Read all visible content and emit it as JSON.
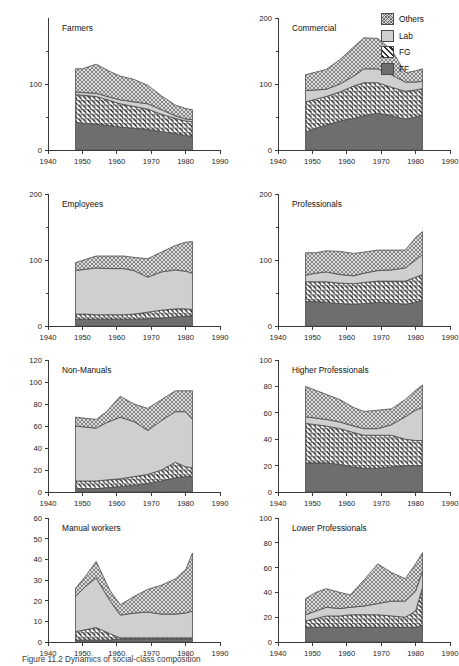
{
  "figure": {
    "caption": "Figure 11.2 Dynamics of social-class composition",
    "legend": {
      "position": "top-right",
      "entries": [
        {
          "label": "Others",
          "pattern": "cross-hatch",
          "color": "#d8d8d8"
        },
        {
          "label": "Lab",
          "pattern": "solid-light",
          "color": "#cfcfcf"
        },
        {
          "label": "FG",
          "pattern": "diagonal-stripe",
          "color": "#2b2b2b"
        },
        {
          "label": "FF",
          "pattern": "solid-dark",
          "color": "#6e6e6e"
        }
      ]
    }
  },
  "chart_data": [
    {
      "type": "area",
      "stacked": true,
      "title": "Farmers",
      "xlabel": "",
      "ylabel": "",
      "xlim": [
        1940,
        1990
      ],
      "ylim": [
        0,
        200
      ],
      "xticks": [
        1940,
        1950,
        1960,
        1970,
        1980,
        1990
      ],
      "yticks": [
        0,
        100
      ],
      "yminorticks": [
        50,
        150
      ],
      "grid": false,
      "x": [
        1948,
        1950,
        1954,
        1958,
        1961,
        1965,
        1969,
        1973,
        1977,
        1980,
        1982
      ],
      "series": [
        {
          "name": "FF",
          "values": [
            42,
            41,
            39,
            37,
            35,
            33,
            31,
            28,
            25,
            22,
            21
          ]
        },
        {
          "name": "FG",
          "values": [
            42,
            42,
            42,
            38,
            35,
            33,
            31,
            26,
            23,
            22,
            22
          ]
        },
        {
          "name": "Lab",
          "values": [
            4,
            4,
            5,
            5,
            6,
            7,
            8,
            7,
            4,
            3,
            3
          ]
        },
        {
          "name": "Others",
          "values": [
            35,
            36,
            44,
            39,
            36,
            34,
            28,
            21,
            16,
            16,
            15
          ]
        }
      ]
    },
    {
      "type": "area",
      "stacked": true,
      "title": "Commercial",
      "xlabel": "",
      "ylabel": "",
      "xlim": [
        1940,
        1990
      ],
      "ylim": [
        0,
        200
      ],
      "xticks": [
        1940,
        1950,
        1960,
        1970,
        1980,
        1990
      ],
      "yticks": [
        0,
        100,
        200
      ],
      "yminorticks": [
        50,
        150
      ],
      "grid": false,
      "x": [
        1948,
        1951,
        1954,
        1958,
        1962,
        1965,
        1969,
        1973,
        1977,
        1980,
        1982
      ],
      "series": [
        {
          "name": "FF",
          "values": [
            27,
            33,
            38,
            44,
            48,
            52,
            56,
            52,
            47,
            50,
            53
          ]
        },
        {
          "name": "FG",
          "values": [
            46,
            44,
            43,
            44,
            49,
            50,
            46,
            43,
            42,
            41,
            40
          ]
        },
        {
          "name": "Lab",
          "values": [
            17,
            14,
            11,
            12,
            15,
            21,
            21,
            19,
            14,
            12,
            11
          ]
        },
        {
          "name": "Others",
          "values": [
            24,
            27,
            30,
            37,
            44,
            47,
            46,
            38,
            14,
            17,
            19
          ]
        }
      ]
    },
    {
      "type": "area",
      "stacked": true,
      "title": "Employees",
      "xlabel": "",
      "ylabel": "",
      "xlim": [
        1940,
        1990
      ],
      "ylim": [
        0,
        200
      ],
      "xticks": [
        1940,
        1950,
        1960,
        1970,
        1980,
        1990
      ],
      "yticks": [
        0,
        100,
        200
      ],
      "yminorticks": [
        50,
        150
      ],
      "grid": false,
      "x": [
        1948,
        1951,
        1954,
        1958,
        1962,
        1965,
        1969,
        1973,
        1977,
        1980,
        1982
      ],
      "series": [
        {
          "name": "FF",
          "values": [
            10,
            10,
            10,
            10,
            10,
            10,
            11,
            12,
            14,
            15,
            15
          ]
        },
        {
          "name": "FG",
          "values": [
            8,
            8,
            7,
            7,
            7,
            8,
            10,
            12,
            12,
            11,
            10
          ]
        },
        {
          "name": "Lab",
          "values": [
            66,
            68,
            71,
            70,
            70,
            66,
            53,
            58,
            59,
            57,
            55
          ]
        },
        {
          "name": "Others",
          "values": [
            12,
            15,
            18,
            19,
            19,
            20,
            28,
            30,
            37,
            44,
            48
          ]
        }
      ]
    },
    {
      "type": "area",
      "stacked": true,
      "title": "Professionals",
      "xlabel": "",
      "ylabel": "",
      "xlim": [
        1940,
        1990
      ],
      "ylim": [
        0,
        200
      ],
      "xticks": [
        1940,
        1950,
        1960,
        1970,
        1980,
        1990
      ],
      "yticks": [
        0,
        100,
        200
      ],
      "yminorticks": [
        50,
        150
      ],
      "grid": false,
      "x": [
        1948,
        1951,
        1954,
        1958,
        1962,
        1965,
        1969,
        1973,
        1977,
        1980,
        1982
      ],
      "series": [
        {
          "name": "FF",
          "values": [
            37,
            37,
            36,
            34,
            33,
            34,
            36,
            35,
            33,
            36,
            39
          ]
        },
        {
          "name": "FG",
          "values": [
            30,
            30,
            31,
            31,
            31,
            32,
            32,
            33,
            35,
            38,
            39
          ]
        },
        {
          "name": "Lab",
          "values": [
            10,
            13,
            15,
            13,
            12,
            14,
            16,
            17,
            20,
            26,
            30
          ]
        },
        {
          "name": "Others",
          "values": [
            34,
            31,
            32,
            35,
            34,
            32,
            31,
            30,
            27,
            34,
            35
          ]
        }
      ]
    },
    {
      "type": "area",
      "stacked": true,
      "title": "Non-Manuals",
      "xlabel": "",
      "ylabel": "",
      "xlim": [
        1940,
        1990
      ],
      "ylim": [
        0,
        120
      ],
      "xticks": [
        1940,
        1950,
        1960,
        1970,
        1980,
        1990
      ],
      "yticks": [
        0,
        20,
        40,
        60,
        80,
        100,
        120
      ],
      "grid": false,
      "x": [
        1948,
        1951,
        1954,
        1957,
        1961,
        1965,
        1969,
        1973,
        1977,
        1980,
        1982
      ],
      "series": [
        {
          "name": "FF",
          "values": [
            3,
            3,
            3,
            4,
            5,
            6,
            8,
            10,
            13,
            14,
            14
          ]
        },
        {
          "name": "FG",
          "values": [
            7,
            7,
            7,
            7,
            7,
            8,
            8,
            10,
            14,
            9,
            8
          ]
        },
        {
          "name": "Lab",
          "values": [
            50,
            49,
            48,
            52,
            56,
            50,
            40,
            45,
            46,
            50,
            44
          ]
        },
        {
          "name": "Others",
          "values": [
            8,
            8,
            8,
            10,
            19,
            16,
            20,
            19,
            19,
            19,
            26
          ]
        }
      ]
    },
    {
      "type": "area",
      "stacked": true,
      "title": "Higher Professionals",
      "xlabel": "",
      "ylabel": "",
      "xlim": [
        1940,
        1990
      ],
      "ylim": [
        0,
        100
      ],
      "xticks": [
        1940,
        1950,
        1960,
        1970,
        1980,
        1990
      ],
      "yticks": [
        0,
        20,
        40,
        60,
        80,
        100
      ],
      "grid": false,
      "x": [
        1948,
        1951,
        1954,
        1958,
        1962,
        1965,
        1969,
        1973,
        1977,
        1980,
        1982
      ],
      "series": [
        {
          "name": "FF",
          "values": [
            22,
            22,
            22,
            21,
            19,
            18,
            18,
            19,
            20,
            20,
            20
          ]
        },
        {
          "name": "FG",
          "values": [
            30,
            29,
            28,
            27,
            26,
            25,
            25,
            24,
            20,
            19,
            19
          ]
        },
        {
          "name": "Lab",
          "values": [
            5,
            5,
            5,
            5,
            5,
            5,
            5,
            8,
            17,
            23,
            25
          ]
        },
        {
          "name": "Others",
          "values": [
            23,
            21,
            19,
            17,
            14,
            13,
            14,
            12,
            13,
            15,
            17
          ]
        }
      ]
    },
    {
      "type": "area",
      "stacked": true,
      "title": "Manual workers",
      "xlabel": "",
      "ylabel": "",
      "xlim": [
        1940,
        1990
      ],
      "ylim": [
        0,
        60
      ],
      "xticks": [
        1940,
        1950,
        1960,
        1970,
        1980,
        1990
      ],
      "yticks": [
        0,
        10,
        20,
        30,
        40,
        50,
        60
      ],
      "grid": false,
      "x": [
        1948,
        1951,
        1954,
        1958,
        1961,
        1965,
        1969,
        1973,
        1977,
        1980,
        1982
      ],
      "series": [
        {
          "name": "FF",
          "values": [
            1,
            1,
            1,
            1,
            1.5,
            1.5,
            1.5,
            1.5,
            1.5,
            1.5,
            1.5
          ]
        },
        {
          "name": "FG",
          "values": [
            4,
            5,
            6,
            3,
            0.5,
            0.5,
            0.5,
            0.5,
            0.5,
            0.5,
            0.5
          ]
        },
        {
          "name": "Lab",
          "values": [
            17,
            21,
            24,
            16,
            11,
            12,
            12.5,
            11.5,
            11.5,
            12,
            13
          ]
        },
        {
          "name": "Others",
          "values": [
            4,
            5,
            8,
            5,
            5,
            8,
            11,
            14,
            17,
            21,
            28
          ]
        }
      ]
    },
    {
      "type": "area",
      "stacked": true,
      "title": "Lower Professionals",
      "xlabel": "",
      "ylabel": "",
      "xlim": [
        1940,
        1990
      ],
      "ylim": [
        0,
        100
      ],
      "xticks": [
        1940,
        1950,
        1960,
        1970,
        1980,
        1990
      ],
      "yticks": [
        0,
        20,
        40,
        60,
        80,
        100
      ],
      "grid": false,
      "x": [
        1948,
        1951,
        1954,
        1958,
        1961,
        1965,
        1969,
        1973,
        1977,
        1980,
        1982
      ],
      "series": [
        {
          "name": "FF",
          "values": [
            12,
            12,
            12,
            12,
            12,
            12,
            12,
            12,
            12,
            12,
            13
          ]
        },
        {
          "name": "FG",
          "values": [
            5,
            7,
            9,
            9,
            10,
            10,
            10,
            9,
            8,
            13,
            31
          ]
        },
        {
          "name": "Lab",
          "values": [
            5,
            6,
            7,
            6,
            6,
            7,
            9,
            12,
            13,
            16,
            13
          ]
        },
        {
          "name": "Others",
          "values": [
            13,
            15,
            15,
            13,
            10,
            21,
            32,
            23,
            18,
            22,
            15
          ]
        }
      ]
    }
  ]
}
